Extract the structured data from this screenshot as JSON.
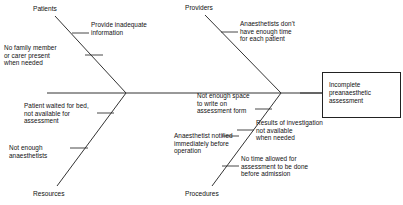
{
  "diagram": {
    "type": "fishbone-cause-and-effect",
    "effect": {
      "text": "Incomplete\npreanaesthetic\nassessment"
    },
    "categories": [
      {
        "name": "patients",
        "label": "Patients"
      },
      {
        "name": "providers",
        "label": "Providers"
      },
      {
        "name": "resources",
        "label": "Resources"
      },
      {
        "name": "procedures",
        "label": "Procedures"
      }
    ],
    "causes": [
      {
        "category": "patients",
        "text": "Provide inadequate\ninformation"
      },
      {
        "category": "patients",
        "text": "No family member\nor carer present\nwhen needed"
      },
      {
        "category": "providers",
        "text": "Anaesthetists don't\nhave enough time\nfor each patient"
      },
      {
        "category": "resources",
        "text": "Patient waited for bed,\nnot available for\nassessment"
      },
      {
        "category": "resources",
        "text": "Not enough\nanaesthetists"
      },
      {
        "category": "procedures",
        "text": "Not enough space\nto write on\nassessment form"
      },
      {
        "category": "procedures",
        "text": "Anaesthetist notified\nimmediately before\noperation"
      },
      {
        "category": "procedures",
        "text": "Results of investigation\nnot available\nwhen needed"
      },
      {
        "category": "procedures",
        "text": "No time allowed for\nassessment to be done\nbefore admission"
      }
    ],
    "colors": {
      "line": "#333333",
      "text": "#111111",
      "background": "#ffffff"
    }
  }
}
